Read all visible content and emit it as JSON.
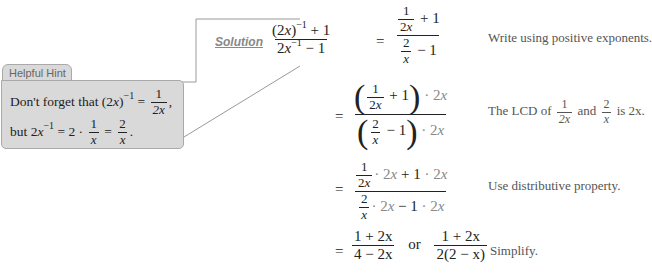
{
  "hint": {
    "title": "Helpful Hint",
    "line1_text": "Don't forget that",
    "line1_expr_base": "(2x)",
    "line1_exp": "−1",
    "line1_eq": "=",
    "line1_frac_num": "1",
    "line1_frac_den": "2x",
    "line1_punct": ",",
    "line2_text": "but",
    "line2_base": "2x",
    "line2_exp": "−1",
    "line2_mid": "= 2 ·",
    "line2_frac1_num": "1",
    "line2_frac1_den": "x",
    "line2_eq": "=",
    "line2_frac2_num": "2",
    "line2_frac2_den": "x",
    "line2_punct": "."
  },
  "solution": {
    "label": "Solution",
    "steps": [
      {
        "lhs_num": "(2x)⁻¹ + 1",
        "lhs_den": "2x⁻¹ − 1",
        "eq": "=",
        "note": "Write using positive exponents."
      },
      {
        "eq": "=",
        "note_prefix": "The LCD of",
        "note_f1_num": "1",
        "note_f1_den": "2x",
        "note_and": "and",
        "note_f2_num": "2",
        "note_f2_den": "x",
        "note_suffix": "is 2x."
      },
      {
        "eq": "=",
        "note": "Use distributive property."
      },
      {
        "eq": "=",
        "result1_num": "1 + 2x",
        "result1_den": "4 − 2x",
        "or": "or",
        "result2_num": "1 + 2x",
        "result2_den": "2(2 − x)",
        "note": "Simplify."
      }
    ],
    "common": {
      "one": "1",
      "two": "2",
      "twox": "2x",
      "x": "x",
      "plus1": "+ 1",
      "minus1": "− 1",
      "dot2x": "· 2x",
      "plus": "+",
      "minus": "−",
      "dot": "·"
    }
  },
  "colors": {
    "hint_bg": "#d9d9d9",
    "hint_border": "#a9a9a9",
    "muted_text": "#888888",
    "note_text": "#555555"
  }
}
